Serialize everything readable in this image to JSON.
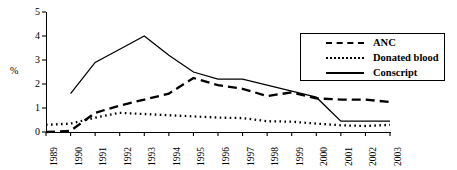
{
  "chart_data": {
    "type": "line",
    "title": "",
    "xlabel": "",
    "ylabel": "%",
    "ylim": [
      0,
      5
    ],
    "yticks": [
      0,
      1,
      2,
      3,
      4,
      5
    ],
    "grid": false,
    "legend_position": "top-right",
    "categories": [
      "1989",
      "1990",
      "1991",
      "1992",
      "1993",
      "1994",
      "1995",
      "1996",
      "1997",
      "1998",
      "1999",
      "2000",
      "2001",
      "2002",
      "2003"
    ],
    "series": [
      {
        "name": "ANC",
        "style": "dashed",
        "color": "#000000",
        "values": [
          0,
          0.05,
          0.8,
          1.1,
          1.35,
          1.6,
          2.25,
          1.95,
          1.8,
          1.5,
          1.65,
          1.4,
          1.35,
          1.35,
          1.25
        ]
      },
      {
        "name": "Donated blood",
        "style": "dotted",
        "color": "#000000",
        "values": [
          0.3,
          0.35,
          0.6,
          0.8,
          0.75,
          0.7,
          0.65,
          0.6,
          0.58,
          0.45,
          0.43,
          0.35,
          0.28,
          0.25,
          0.3
        ]
      },
      {
        "name": "Conscript",
        "style": "solid",
        "color": "#000000",
        "values": [
          null,
          1.6,
          2.9,
          3.45,
          4.0,
          3.2,
          2.5,
          2.2,
          2.2,
          1.95,
          1.7,
          1.45,
          0.45,
          0.45,
          0.45
        ]
      }
    ]
  },
  "legend": {
    "items": [
      {
        "label": "ANC",
        "style": "dashed"
      },
      {
        "label": "Donated blood",
        "style": "dotted"
      },
      {
        "label": "Conscript",
        "style": "solid"
      }
    ]
  }
}
